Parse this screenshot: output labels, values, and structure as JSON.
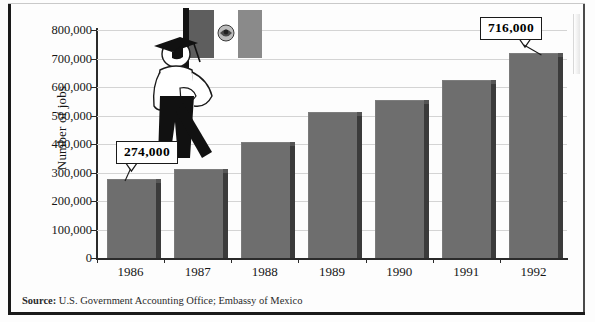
{
  "chart_data": {
    "type": "bar",
    "title": "",
    "xlabel": "",
    "ylabel": "Number of jobs",
    "categories": [
      "1986",
      "1987",
      "1988",
      "1989",
      "1990",
      "1991",
      "1992"
    ],
    "values": [
      274000,
      310000,
      405000,
      510000,
      550000,
      620000,
      716000
    ],
    "ylim": [
      0,
      800000
    ],
    "ytick_labels": [
      "800,000",
      "700,000",
      "600,000",
      "500,000",
      "400,000",
      "300,000",
      "200,000",
      "100,000",
      "0"
    ],
    "ytick_values": [
      800000,
      700000,
      600000,
      500000,
      400000,
      300000,
      200000,
      100000,
      0
    ],
    "grid": true,
    "legend": "none",
    "bar_color": "#6e6e6e",
    "bar_side_color": "#3b3b3b",
    "annotations": [
      {
        "label": "274,000",
        "category": "1986",
        "value": 274000
      },
      {
        "label": "716,000",
        "category": "1992",
        "value": 716000
      }
    ]
  },
  "axis": {
    "y_title": "Number of jobs"
  },
  "footer": {
    "source_label": "Source:",
    "source_text": "U.S. Government Accounting Office; Embassy of Mexico"
  },
  "illustration": {
    "name": "graduate-holding-mexican-flag",
    "flag_left_color": "#5e5e5e",
    "flag_right_color": "#8a8a8a",
    "flag_center_color": "#ffffff",
    "pole_color": "#1a1a1a",
    "cap_color": "#111111",
    "trousers_color": "#111111",
    "shirt_color": "#ffffff"
  }
}
